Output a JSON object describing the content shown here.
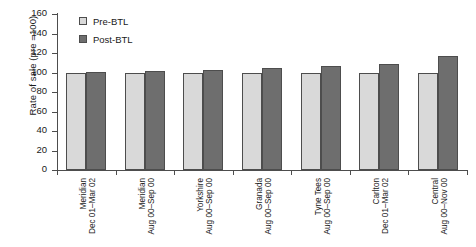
{
  "chart_data": {
    "type": "bar",
    "title": "",
    "xlabel": "",
    "ylabel": "Rate of sale (pre =100)",
    "ylim": [
      0,
      160
    ],
    "yticks": [
      0,
      20,
      40,
      60,
      80,
      100,
      120,
      140,
      160
    ],
    "ytick_labels": [
      "0",
      "20",
      "40",
      "60",
      "80",
      "100",
      "120",
      "140",
      "160"
    ],
    "grid": false,
    "legend_position": "top-left",
    "categories": [
      "Meridian Dec 01–Mar 02",
      "Meridian Aug 00–Sep 00",
      "Yorkshire Aug 00–Sep 00",
      "Granada Aug 00–Sep 00",
      "Tyne Tees Aug 00–Sep 00",
      "Carlton Dec 01–Mar 02",
      "Central Aug 00–Nov 00"
    ],
    "category_lines": [
      [
        "Meridian",
        "Dec 01–Mar 02"
      ],
      [
        "Meridian",
        "Aug 00–Sep 00"
      ],
      [
        "Yorkshire",
        "Aug 00–Sep 00"
      ],
      [
        "Granada",
        "Aug 00–Sep 00"
      ],
      [
        "Tyne Tees",
        "Aug 00–Sep 00"
      ],
      [
        "Carlton",
        "Dec 01–Mar 02"
      ],
      [
        "Central",
        "Aug 00–Nov 00"
      ]
    ],
    "series": [
      {
        "name": "Pre-BTL",
        "color": "#d9d9d9",
        "values": [
          100,
          100,
          100,
          100,
          100,
          100,
          100
        ]
      },
      {
        "name": "Post-BTL",
        "color": "#6e6e6e",
        "values": [
          101,
          102,
          103,
          105,
          107,
          109,
          117
        ]
      }
    ]
  },
  "legend": {
    "items": [
      {
        "label": "Pre-BTL"
      },
      {
        "label": "Post-BTL"
      }
    ]
  },
  "colors": {
    "pre_bar": "#d9d9d9",
    "post_bar": "#6e6e6e",
    "axis": "#4d4d4d",
    "text": "#1a1a1a",
    "background": "#ffffff"
  }
}
